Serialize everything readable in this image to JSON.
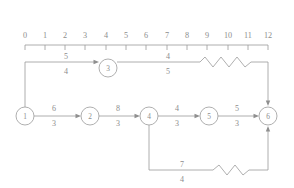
{
  "diagram": {
    "kind": "activity-network-diagram",
    "line_color": "#9a9a9a",
    "text_color": "#8d8d8d",
    "background_color": "#ffffff"
  },
  "time_axis": {
    "name": "time-axis",
    "min": 0,
    "max": 12,
    "ticks": [
      {
        "value": 0,
        "label": "0",
        "x": 25
      },
      {
        "value": 1,
        "label": "1",
        "x": 45
      },
      {
        "value": 2,
        "label": "2",
        "x": 65
      },
      {
        "value": 3,
        "label": "3",
        "x": 85
      },
      {
        "value": 4,
        "label": "4",
        "x": 106
      },
      {
        "value": 5,
        "label": "5",
        "x": 126
      },
      {
        "value": 6,
        "label": "6",
        "x": 146
      },
      {
        "value": 7,
        "label": "7",
        "x": 167
      },
      {
        "value": 8,
        "label": "8",
        "x": 187
      },
      {
        "value": 9,
        "label": "9",
        "x": 207
      },
      {
        "value": 10,
        "label": "10",
        "x": 228
      },
      {
        "value": 11,
        "label": "11",
        "x": 248
      },
      {
        "value": 12,
        "label": "12",
        "x": 268
      }
    ]
  },
  "nodes": [
    {
      "id": "1",
      "label": "1",
      "cx": 25,
      "cy": 116,
      "r": 9
    },
    {
      "id": "2",
      "label": "2",
      "cx": 90,
      "cy": 116,
      "r": 9
    },
    {
      "id": "3",
      "label": "3",
      "cx": 108,
      "cy": 68,
      "r": 9
    },
    {
      "id": "4",
      "label": "4",
      "cx": 149,
      "cy": 116,
      "r": 9
    },
    {
      "id": "5",
      "label": "5",
      "cx": 209,
      "cy": 116,
      "r": 9
    },
    {
      "id": "6",
      "label": "6",
      "cx": 268,
      "cy": 116,
      "r": 9
    }
  ],
  "edges": [
    {
      "name": "edge-1-to-3",
      "from": "1",
      "to": "3",
      "label_top": "5",
      "label_bottom": "4",
      "label_x": 66,
      "label_top_y": 62,
      "label_bottom_y": 78,
      "has_wave": false
    },
    {
      "name": "edge-3-to-6",
      "from": "3",
      "to": "6",
      "label_top": "4",
      "label_bottom": "5",
      "label_x": 168,
      "label_top_y": 62,
      "label_bottom_y": 78,
      "has_wave": true
    },
    {
      "name": "edge-1-to-2",
      "from": "1",
      "to": "2",
      "label_top": "6",
      "label_bottom": "3",
      "label_x": 52,
      "label_top_y": 110,
      "label_bottom_y": 126,
      "has_wave": false
    },
    {
      "name": "edge-2-to-4",
      "from": "2",
      "to": "4",
      "label_top": "8",
      "label_bottom": "3",
      "label_x": 118,
      "label_top_y": 110,
      "label_bottom_y": 126,
      "has_wave": false
    },
    {
      "name": "edge-4-to-5",
      "from": "4",
      "to": "5",
      "label_top": "4",
      "label_bottom": "3",
      "label_x": 177,
      "label_top_y": 110,
      "label_bottom_y": 126,
      "has_wave": false
    },
    {
      "name": "edge-5-to-6",
      "from": "5",
      "to": "6",
      "label_top": "5",
      "label_bottom": "3",
      "label_x": 237,
      "label_top_y": 110,
      "label_bottom_y": 126,
      "has_wave": false
    },
    {
      "name": "edge-4-to-6-lower",
      "from": "4",
      "to": "6",
      "label_top": "7",
      "label_bottom": "4",
      "label_x": 182,
      "label_top_y": 165,
      "label_bottom_y": 181,
      "has_wave": true
    }
  ]
}
